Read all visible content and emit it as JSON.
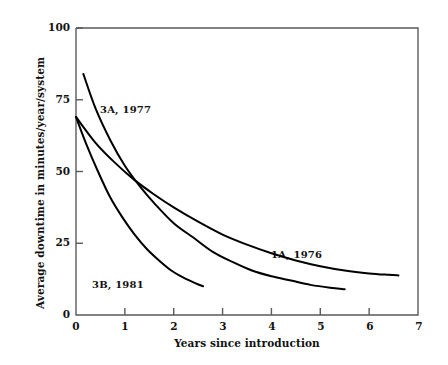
{
  "chart_data": {
    "type": "line",
    "title": "",
    "xlabel": "Years since introduction",
    "ylabel": "Average downtime in minutes/year/system",
    "xlim": [
      0,
      7
    ],
    "ylim": [
      0,
      100
    ],
    "grid": false,
    "legend_position": "inline-annotations",
    "xticks": [
      "0",
      "1",
      "2",
      "3",
      "4",
      "5",
      "6",
      "7"
    ],
    "yticks": [
      "0",
      "25",
      "50",
      "75",
      "100"
    ],
    "series": [
      {
        "name": "3A, 1977",
        "label": "3A, 1977",
        "color": "#000000",
        "x": [
          0.15,
          0.4,
          0.7,
          1.0,
          1.3,
          1.6,
          2.0,
          2.4,
          2.8,
          3.2,
          3.6,
          4.0,
          4.4,
          4.8,
          5.2,
          5.5
        ],
        "y": [
          84,
          72,
          61,
          52,
          45,
          39,
          32,
          27,
          22,
          18.5,
          15.5,
          13.5,
          12,
          10.5,
          9.5,
          9
        ]
      },
      {
        "name": "1A, 1976",
        "label": "1A, 1976",
        "color": "#000000",
        "x": [
          0.0,
          0.4,
          0.8,
          1.2,
          1.6,
          2.0,
          2.5,
          3.0,
          3.5,
          4.0,
          4.5,
          5.0,
          5.5,
          6.0,
          6.4,
          6.6
        ],
        "y": [
          69,
          60,
          53,
          47,
          42,
          37.5,
          32.5,
          28,
          24.5,
          21.5,
          19,
          17,
          15.5,
          14.5,
          14,
          13.8
        ]
      },
      {
        "name": "3B, 1981",
        "label": "3B, 1981",
        "color": "#000000",
        "x": [
          0.0,
          0.2,
          0.45,
          0.7,
          0.95,
          1.2,
          1.45,
          1.7,
          1.95,
          2.2,
          2.45,
          2.6
        ],
        "y": [
          69,
          60,
          50,
          41,
          34,
          28,
          23,
          19,
          15.5,
          13,
          11,
          10
        ]
      }
    ],
    "annotations": [
      {
        "text": "3A, 1977",
        "x_px": 100,
        "y_px": 104
      },
      {
        "text": "1A, 1976",
        "x_px": 271,
        "y_px": 249
      },
      {
        "text": "3B, 1981",
        "x_px": 92,
        "y_px": 279
      }
    ]
  },
  "axes": {
    "y_title": "Average downtime in minutes/year/system",
    "x_title": "Years since introduction",
    "y_ticks": [
      {
        "label": "100",
        "value": 100
      },
      {
        "label": "75",
        "value": 75
      },
      {
        "label": "50",
        "value": 50
      },
      {
        "label": "25",
        "value": 25
      },
      {
        "label": "0",
        "value": 0
      }
    ],
    "x_ticks": [
      {
        "label": "0",
        "value": 0
      },
      {
        "label": "1",
        "value": 1
      },
      {
        "label": "2",
        "value": 2
      },
      {
        "label": "3",
        "value": 3
      },
      {
        "label": "4",
        "value": 4
      },
      {
        "label": "5",
        "value": 5
      },
      {
        "label": "6",
        "value": 6
      },
      {
        "label": "7",
        "value": 7
      }
    ]
  },
  "style": {
    "background": "#ffffff",
    "axis_color": "#5a5a5a",
    "curve_color": "#000000",
    "text_color": "#111111"
  }
}
